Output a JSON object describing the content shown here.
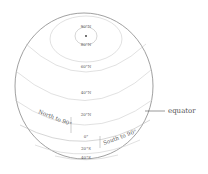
{
  "diagram": {
    "latitude_labels": {
      "n90": "90°N",
      "n80": "80°N",
      "n60": "60°N",
      "n40": "40°N",
      "n20": "20°N",
      "eq": "0°",
      "s20": "20°S",
      "s40": "40°S"
    },
    "annotations": {
      "north": "North to 90°",
      "south": "South to 90°",
      "equator": "equator"
    },
    "colors": {
      "outline": "#777777",
      "lines": "#cccccc",
      "text": "#555555"
    }
  }
}
